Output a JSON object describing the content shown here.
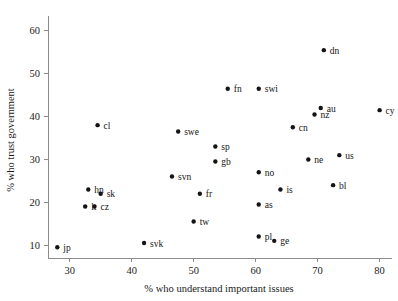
{
  "chart_data": {
    "type": "scatter",
    "title": "",
    "xlabel": "% who understand important issues",
    "ylabel": "% who trust government",
    "xlim": [
      26.5,
      82
    ],
    "ylim": [
      7,
      63
    ],
    "xticks": [
      30,
      40,
      50,
      60,
      70,
      80
    ],
    "yticks": [
      10,
      20,
      30,
      40,
      50,
      60
    ],
    "grid": false,
    "legend": null,
    "points": [
      {
        "label": "jp",
        "x": 28.0,
        "y": 9.5,
        "lx": 6,
        "ly": 3.5
      },
      {
        "label": "lt",
        "x": 32.5,
        "y": 19.0,
        "lx": 6,
        "ly": 3.5
      },
      {
        "label": "cz",
        "x": 34.0,
        "y": 19.0,
        "lx": 6,
        "ly": 3.5
      },
      {
        "label": "hn",
        "x": 33.0,
        "y": 23.0,
        "lx": 6,
        "ly": 3.5
      },
      {
        "label": "sk",
        "x": 35.0,
        "y": 22.0,
        "lx": 6,
        "ly": 3.5
      },
      {
        "label": "cl",
        "x": 34.5,
        "y": 38.0,
        "lx": 6,
        "ly": 3.5
      },
      {
        "label": "svk",
        "x": 42.0,
        "y": 10.5,
        "lx": 6,
        "ly": 3.5
      },
      {
        "label": "svn",
        "x": 46.5,
        "y": 26.0,
        "lx": 6,
        "ly": 3.5
      },
      {
        "label": "swe",
        "x": 47.5,
        "y": 36.5,
        "lx": 6,
        "ly": 3.5
      },
      {
        "label": "tw",
        "x": 50.0,
        "y": 15.5,
        "lx": 6,
        "ly": 3.5
      },
      {
        "label": "fr",
        "x": 51.0,
        "y": 22.0,
        "lx": 6,
        "ly": 3.5
      },
      {
        "label": "sp",
        "x": 53.5,
        "y": 33.0,
        "lx": 6,
        "ly": 3.5
      },
      {
        "label": "gb",
        "x": 53.5,
        "y": 29.5,
        "lx": 6,
        "ly": 3.5
      },
      {
        "label": "fn",
        "x": 55.5,
        "y": 46.5,
        "lx": 6,
        "ly": 3.5
      },
      {
        "label": "swi",
        "x": 60.5,
        "y": 46.5,
        "lx": 6,
        "ly": 3.5
      },
      {
        "label": "no",
        "x": 60.5,
        "y": 27.0,
        "lx": 6,
        "ly": 3.5
      },
      {
        "label": "as",
        "x": 60.5,
        "y": 19.5,
        "lx": 6,
        "ly": 3.5
      },
      {
        "label": "pl",
        "x": 60.5,
        "y": 12.0,
        "lx": 6,
        "ly": 3.5
      },
      {
        "label": "ge",
        "x": 63.0,
        "y": 11.0,
        "lx": 6,
        "ly": 3.5
      },
      {
        "label": "is",
        "x": 64.0,
        "y": 23.0,
        "lx": 6,
        "ly": 3.5
      },
      {
        "label": "cn",
        "x": 66.0,
        "y": 37.5,
        "lx": 6,
        "ly": 3.5
      },
      {
        "label": "ne",
        "x": 68.5,
        "y": 30.0,
        "lx": 6,
        "ly": 3.5
      },
      {
        "label": "nz",
        "x": 69.5,
        "y": 40.5,
        "lx": 6,
        "ly": 3.5
      },
      {
        "label": "au",
        "x": 70.5,
        "y": 42.0,
        "lx": 6,
        "ly": 3.5
      },
      {
        "label": "dn",
        "x": 71.0,
        "y": 55.5,
        "lx": 6,
        "ly": 3.5
      },
      {
        "label": "bl",
        "x": 72.5,
        "y": 24.0,
        "lx": 6,
        "ly": 3.5
      },
      {
        "label": "us",
        "x": 73.5,
        "y": 31.0,
        "lx": 6,
        "ly": 3.5
      },
      {
        "label": "cy",
        "x": 80.0,
        "y": 41.5,
        "lx": 6,
        "ly": 3.5
      }
    ]
  }
}
